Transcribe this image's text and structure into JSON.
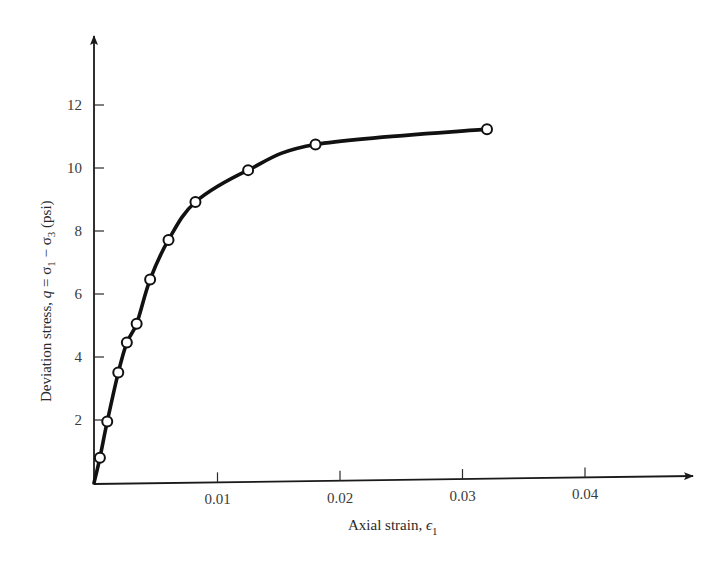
{
  "chart_data": {
    "type": "line",
    "title": "",
    "xlabel": "Axial strain, ε₁",
    "xlabel_main": "Axial strain, ",
    "xlabel_symbol": "ϵ",
    "xlabel_sub": "1",
    "ylabel": "Deviation stress, q = σ₁ − σ₃ (psi)",
    "ylabel_prefix": "Deviation stress, ",
    "ylabel_q": "q",
    "ylabel_eq": " = σ",
    "ylabel_sub1": "1",
    "ylabel_minus": " − σ",
    "ylabel_sub3": "3",
    "ylabel_unit": " (psi)",
    "xlim": [
      0,
      0.047
    ],
    "ylim": [
      0,
      14
    ],
    "grid": false,
    "legend": null,
    "x_ticks": [
      0.01,
      0.02,
      0.03,
      0.04
    ],
    "x_tick_labels": [
      "0.01",
      "0.02",
      "0.03",
      "0.04"
    ],
    "y_ticks": [
      2,
      4,
      6,
      8,
      10,
      12
    ],
    "y_tick_labels": [
      "2",
      "4",
      "6",
      "8",
      "10",
      "12"
    ],
    "series": [
      {
        "name": "Deviation stress vs axial strain",
        "marker": "open-circle",
        "line": "smooth",
        "x": [
          0.0004,
          0.001,
          0.0019,
          0.0026,
          0.0034,
          0.0045,
          0.006,
          0.0082,
          0.0125,
          0.018,
          0.032
        ],
        "y": [
          0.8,
          1.95,
          3.5,
          4.45,
          5.05,
          6.45,
          7.7,
          8.9,
          9.9,
          10.7,
          11.15
        ]
      }
    ]
  }
}
